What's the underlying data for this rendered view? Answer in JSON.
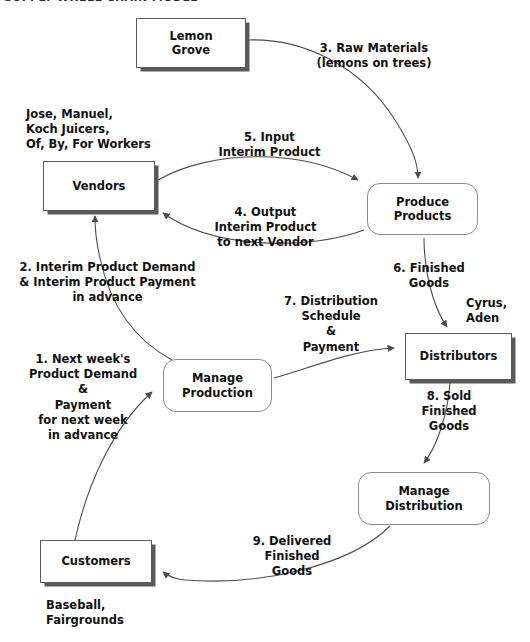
{
  "title": "SUPPLY WHEEL CHAIN MODEL",
  "nodes": [
    {
      "id": "lemon-grove",
      "label": "Lemon\nGrove",
      "kind": "entity",
      "x": 136,
      "y": 18,
      "w": 110,
      "h": 50
    },
    {
      "id": "vendors",
      "label": "Vendors",
      "kind": "entity",
      "x": 43,
      "y": 161,
      "w": 112,
      "h": 50
    },
    {
      "id": "produce-products",
      "label": "Produce\nProducts",
      "kind": "process",
      "x": 367,
      "y": 183,
      "w": 111,
      "h": 52
    },
    {
      "id": "manage-production",
      "label": "Manage\nProduction",
      "kind": "process",
      "x": 163,
      "y": 359,
      "w": 109,
      "h": 53
    },
    {
      "id": "distributors",
      "label": "Distributors",
      "kind": "entity",
      "x": 405,
      "y": 333,
      "w": 107,
      "h": 47
    },
    {
      "id": "manage-distribution",
      "label": "Manage\nDistribution",
      "kind": "process",
      "x": 358,
      "y": 472,
      "w": 132,
      "h": 53
    },
    {
      "id": "customers",
      "label": "Customers",
      "kind": "entity",
      "x": 40,
      "y": 540,
      "w": 112,
      "h": 43
    }
  ],
  "annotations": [
    {
      "id": "vendors-actors",
      "text": "Jose, Manuel,\nKoch Juicers,\nOf, By, For Workers",
      "x": 26,
      "y": 107,
      "align": "l"
    },
    {
      "id": "distributors-actors",
      "text": "Cyrus,\nAden",
      "x": 466,
      "y": 296,
      "align": "l"
    },
    {
      "id": "customers-actors",
      "text": "Baseball,\nFairgrounds",
      "x": 46,
      "y": 598,
      "align": "l"
    }
  ],
  "flows": [
    {
      "id": "flow-1",
      "number": "1.",
      "text": "1. Next week's\nProduct Demand\n&\nPayment\nfor next week\nin advance",
      "x": 18,
      "y": 352,
      "align": "c",
      "width": 130
    },
    {
      "id": "flow-2",
      "number": "2.",
      "text": "2. Interim Product Demand\n& Interim Product Payment\nin advance",
      "x": 10,
      "y": 260,
      "align": "c",
      "width": 195
    },
    {
      "id": "flow-3",
      "number": "3.",
      "text": "3. Raw Materials\n(lemons on trees)",
      "x": 309,
      "y": 41,
      "align": "c",
      "width": 130
    },
    {
      "id": "flow-4",
      "number": "4.",
      "text": "4. Output\nInterim Product\nto next Vendor",
      "x": 203,
      "y": 205,
      "align": "c",
      "width": 125
    },
    {
      "id": "flow-5",
      "number": "5.",
      "text": "5. Input\nInterim Product",
      "x": 207,
      "y": 130,
      "align": "c",
      "width": 125
    },
    {
      "id": "flow-6",
      "number": "6.",
      "text": "6. Finished\nGoods",
      "x": 383,
      "y": 261,
      "align": "c",
      "width": 92
    },
    {
      "id": "flow-7",
      "number": "7.",
      "text": "7. Distribution\nSchedule\n&\nPayment",
      "x": 272,
      "y": 294,
      "align": "c",
      "width": 118
    },
    {
      "id": "flow-8",
      "number": "8.",
      "text": "8. Sold\nFinished\nGoods",
      "x": 404,
      "y": 389,
      "align": "c",
      "width": 90
    },
    {
      "id": "flow-9",
      "number": "9.",
      "text": "9. Delivered\nFinished\nGoods",
      "x": 232,
      "y": 534,
      "align": "c",
      "width": 120
    }
  ],
  "style": {
    "edge_color": "#4d4d4d",
    "arrow_color": "#4d4d4d",
    "entity_border": "#5a5a5a",
    "process_border": "#8d8d8d",
    "shadow_color": "#5a5a5a",
    "text_color": "#111111",
    "background": "#ffffff"
  }
}
